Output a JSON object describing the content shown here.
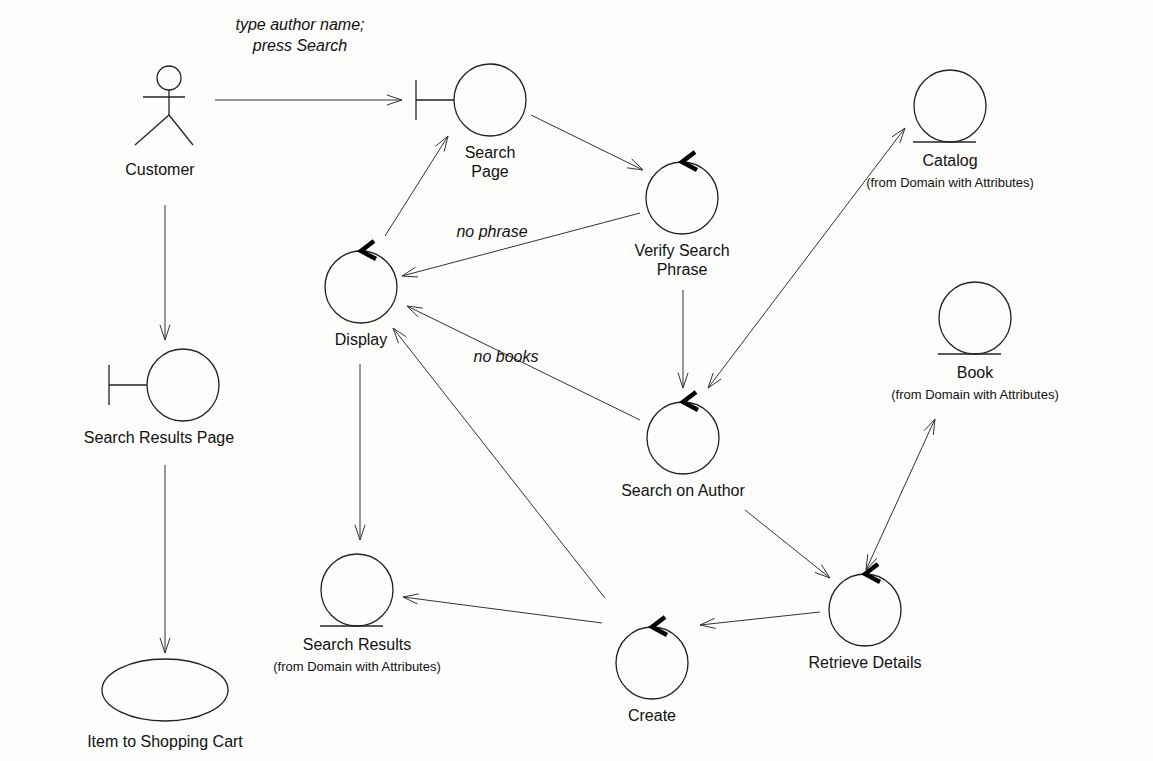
{
  "diagram": {
    "actor": {
      "id": "customer",
      "label": "Customer",
      "x": 169,
      "y": 78
    },
    "nodes": [
      {
        "id": "search-page",
        "type": "boundary",
        "label": [
          "Search",
          "Page"
        ],
        "cx": 490,
        "cy": 100,
        "r": 36
      },
      {
        "id": "verify-search-phrase",
        "type": "control",
        "label": [
          "Verify Search",
          "Phrase"
        ],
        "cx": 682,
        "cy": 198,
        "r": 36
      },
      {
        "id": "catalog",
        "type": "entity",
        "label": [
          "Catalog"
        ],
        "sub": "(from Domain with Attributes)",
        "cx": 950,
        "cy": 106,
        "r": 36
      },
      {
        "id": "display",
        "type": "control",
        "label": [
          "Display"
        ],
        "cx": 361,
        "cy": 287,
        "r": 36
      },
      {
        "id": "search-results-page",
        "type": "boundary",
        "label": [
          "Search Results Page"
        ],
        "cx": 183,
        "cy": 385,
        "r": 36
      },
      {
        "id": "book",
        "type": "entity",
        "label": [
          "Book"
        ],
        "sub": "(from Domain with Attributes)",
        "cx": 975,
        "cy": 318,
        "r": 36
      },
      {
        "id": "search-on-author",
        "type": "control",
        "label": [
          "Search on Author"
        ],
        "cx": 683,
        "cy": 438,
        "r": 36
      },
      {
        "id": "search-results",
        "type": "entity",
        "label": [
          "Search Results"
        ],
        "sub": "(from Domain with Attributes)",
        "cx": 357,
        "cy": 590,
        "r": 36
      },
      {
        "id": "create",
        "type": "control",
        "label": [
          "Create"
        ],
        "cx": 652,
        "cy": 663,
        "r": 36
      },
      {
        "id": "retrieve-details",
        "type": "control",
        "label": [
          "Retrieve Details"
        ],
        "cx": 865,
        "cy": 610,
        "r": 36
      },
      {
        "id": "item-to-shopping-cart",
        "type": "usecase",
        "label": [
          "Item to Shopping Cart"
        ],
        "cx": 165,
        "cy": 690,
        "rx": 63,
        "ry": 31
      }
    ],
    "edges": [
      {
        "from": "customer",
        "to": "search-page",
        "x1": 215,
        "y1": 100,
        "x2": 402,
        "y2": 100,
        "heads": [
          "end"
        ],
        "label": [
          "type author name;",
          "press Search"
        ],
        "lx": 300,
        "ly": 55
      },
      {
        "from": "search-page",
        "to": "verify-search-phrase",
        "x1": 531,
        "y1": 115,
        "x2": 643,
        "y2": 170,
        "heads": [
          "end"
        ]
      },
      {
        "from": "verify-search-phrase",
        "to": "display",
        "x1": 640,
        "y1": 213,
        "x2": 402,
        "y2": 276,
        "heads": [
          "end"
        ],
        "label": [
          "no phrase"
        ],
        "lx": 492,
        "ly": 237
      },
      {
        "from": "display",
        "to": "search-page",
        "x1": 385,
        "y1": 236,
        "x2": 448,
        "y2": 136,
        "heads": [
          "end"
        ]
      },
      {
        "from": "verify-search-phrase",
        "to": "search-on-author",
        "x1": 683,
        "y1": 290,
        "x2": 683,
        "y2": 388,
        "heads": [
          "end"
        ]
      },
      {
        "from": "search-on-author",
        "to": "catalog",
        "x1": 708,
        "y1": 388,
        "x2": 905,
        "y2": 128,
        "heads": [
          "start",
          "end"
        ]
      },
      {
        "from": "search-on-author",
        "to": "display",
        "x1": 640,
        "y1": 420,
        "x2": 407,
        "y2": 306,
        "heads": [
          "end"
        ],
        "label": [
          "no books"
        ],
        "lx": 506,
        "ly": 362
      },
      {
        "from": "customer",
        "to": "search-results-page",
        "x1": 165,
        "y1": 205,
        "x2": 165,
        "y2": 340,
        "heads": [
          "end"
        ]
      },
      {
        "from": "display",
        "to": "search-results",
        "x1": 360,
        "y1": 364,
        "x2": 360,
        "y2": 540,
        "heads": [
          "end"
        ]
      },
      {
        "from": "create",
        "to": "display",
        "x1": 605,
        "y1": 598,
        "x2": 393,
        "y2": 328,
        "heads": [
          "end"
        ]
      },
      {
        "from": "search-on-author",
        "to": "retrieve-details",
        "x1": 745,
        "y1": 510,
        "x2": 830,
        "y2": 578,
        "heads": [
          "end"
        ]
      },
      {
        "from": "retrieve-details",
        "to": "book",
        "x1": 866,
        "y1": 570,
        "x2": 935,
        "y2": 419,
        "heads": [
          "start",
          "end"
        ]
      },
      {
        "from": "retrieve-details",
        "to": "create",
        "x1": 820,
        "y1": 612,
        "x2": 700,
        "y2": 625,
        "heads": [
          "end"
        ]
      },
      {
        "from": "create",
        "to": "search-results",
        "x1": 602,
        "y1": 623,
        "x2": 403,
        "y2": 597,
        "heads": [
          "end"
        ]
      },
      {
        "from": "search-results-page",
        "to": "item-to-shopping-cart",
        "x1": 165,
        "y1": 465,
        "x2": 165,
        "y2": 653,
        "heads": [
          "end"
        ]
      }
    ]
  }
}
